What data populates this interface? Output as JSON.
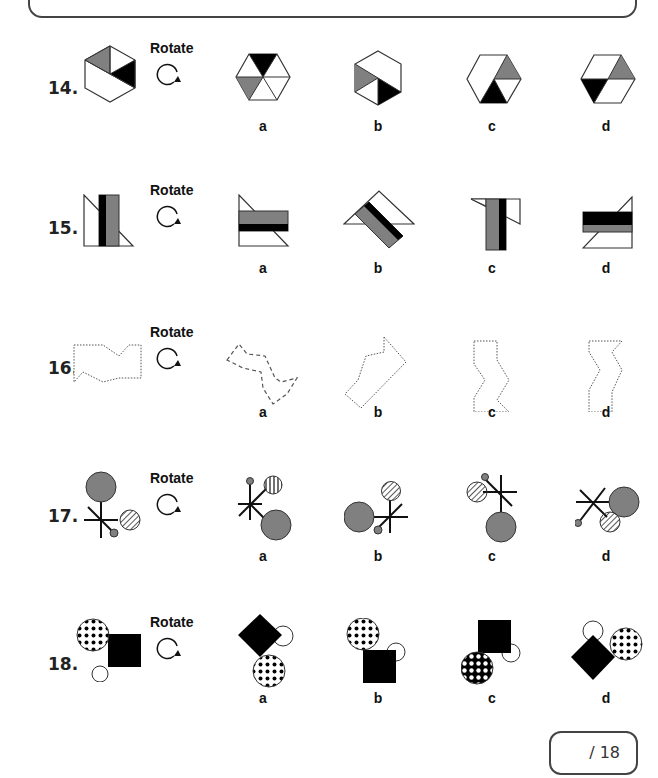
{
  "worksheet": {
    "rotate_label": "Rotate",
    "rotate_icon": "clockwise-rotate-arrow",
    "option_labels": [
      "a",
      "b",
      "c",
      "d"
    ],
    "questions": [
      {
        "number": "14.",
        "shape": "hexagon-triangles",
        "options": [
          "a",
          "b",
          "c",
          "d"
        ]
      },
      {
        "number": "15.",
        "shape": "rectangle-with-triangles",
        "options": [
          "a",
          "b",
          "c",
          "d"
        ]
      },
      {
        "number": "16.",
        "shape": "dotted-zigzag-polygon",
        "options": [
          "a",
          "b",
          "c",
          "d"
        ]
      },
      {
        "number": "17.",
        "shape": "circles-and-star-lines",
        "options": [
          "a",
          "b",
          "c",
          "d"
        ]
      },
      {
        "number": "18.",
        "shape": "dotted-circle-square-circle",
        "options": [
          "a",
          "b",
          "c",
          "d"
        ]
      }
    ],
    "colors": {
      "gray": "#808080",
      "black": "#000000",
      "outline": "#333333"
    }
  },
  "score": {
    "text": "/ 18"
  }
}
